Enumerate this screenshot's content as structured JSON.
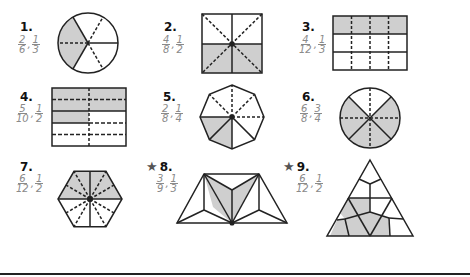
{
  "problems": [
    {
      "number": "1.",
      "starred": false,
      "answer": [
        {
          "n": "2",
          "d": "6"
        },
        {
          "n": "1",
          "d": "3"
        }
      ],
      "shape": "circle-sixths"
    },
    {
      "number": "2.",
      "starred": false,
      "answer": [
        {
          "n": "4",
          "d": "8"
        },
        {
          "n": "1",
          "d": "2"
        }
      ],
      "shape": "square-eighths"
    },
    {
      "number": "3.",
      "starred": false,
      "answer": [
        {
          "n": "4",
          "d": "12"
        },
        {
          "n": "1",
          "d": "3"
        }
      ],
      "shape": "rectangle-twelfths"
    },
    {
      "number": "4.",
      "starred": false,
      "answer": [
        {
          "n": "5",
          "d": "10"
        },
        {
          "n": "1",
          "d": "2"
        }
      ],
      "shape": "rectangle-tenths"
    },
    {
      "number": "5.",
      "starred": false,
      "answer": [
        {
          "n": "2",
          "d": "8"
        },
        {
          "n": "1",
          "d": "4"
        }
      ],
      "shape": "octagon-eighths"
    },
    {
      "number": "6.",
      "starred": false,
      "answer": [
        {
          "n": "6",
          "d": "8"
        },
        {
          "n": "3",
          "d": "4"
        }
      ],
      "shape": "circle-eighths"
    },
    {
      "number": "7.",
      "starred": false,
      "answer": [
        {
          "n": "6",
          "d": "12"
        },
        {
          "n": "1",
          "d": "2"
        }
      ],
      "shape": "hexagon-twelfths"
    },
    {
      "number": "8.",
      "starred": true,
      "answer": [
        {
          "n": "3",
          "d": "9"
        },
        {
          "n": "1",
          "d": "3"
        }
      ],
      "shape": "trapezoid-ninths"
    },
    {
      "number": "9.",
      "starred": true,
      "answer": [
        {
          "n": "6",
          "d": "12"
        },
        {
          "n": "1",
          "d": "2"
        }
      ],
      "shape": "triangle-twelfths"
    }
  ],
  "icons": {
    "star": "★"
  },
  "colors": {
    "shade": "#cfcfcf",
    "stroke": "#222222",
    "answer": "#8a8a8a"
  },
  "separator": ","
}
